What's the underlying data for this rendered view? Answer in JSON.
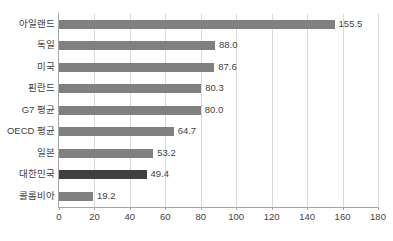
{
  "chart_data": {
    "type": "bar",
    "orientation": "horizontal",
    "title": "",
    "subtitle": "",
    "xlabel": "",
    "ylabel": "",
    "xlim": [
      0,
      180
    ],
    "ylim": null,
    "grid": true,
    "legend": null,
    "legend_position": "none",
    "categories": [
      "아일랜드",
      "독일",
      "미국",
      "핀란드",
      "G7 평균",
      "OECD 평균",
      "일본",
      "대한민국",
      "콜롬비아"
    ],
    "values": [
      155.5,
      88.0,
      87.6,
      80.3,
      80.0,
      64.7,
      53.2,
      49.4,
      19.2
    ],
    "value_labels": [
      "155.5",
      "88.0",
      "87.6",
      "80.3",
      "80.0",
      "64.7",
      "53.2",
      "49.4",
      "19.2"
    ],
    "highlighted_index": 7,
    "x_ticks": [
      0,
      20,
      40,
      60,
      80,
      100,
      120,
      140,
      160,
      180
    ],
    "x_tick_labels": [
      "0",
      "20",
      "40",
      "60",
      "80",
      "100",
      "120",
      "140",
      "160",
      "180"
    ],
    "colors": {
      "bar": "#808080",
      "bar_highlight": "#404040",
      "gridline": "#d9d9d9",
      "axis": "#a6a6a6",
      "text": "#3f3f3f",
      "background": "#ffffff"
    }
  }
}
